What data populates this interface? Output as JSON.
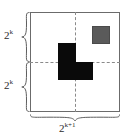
{
  "figure": {
    "name": "tromino-tiling-diagram",
    "board": {
      "border_color": "#6b6b6b",
      "fill_color": "#ffffff",
      "divider_style": "dashed",
      "divider_color": "#8a8a8a"
    },
    "shapes": {
      "tromino": {
        "label": "L-tromino",
        "color": "#0a0a0a",
        "cells": 3
      },
      "defective_square": {
        "label": "removed-square",
        "color": "#5a5a5a",
        "cells": 1
      }
    },
    "labels": {
      "left_top": {
        "base": "2",
        "exponent": "k"
      },
      "left_bottom": {
        "base": "2",
        "exponent": "k"
      },
      "bottom": {
        "base": "2",
        "exponent": "k+1"
      }
    }
  }
}
